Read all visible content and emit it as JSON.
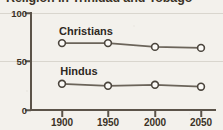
{
  "chart_data": {
    "type": "line",
    "title": "Religion in Trinidad and Tobago",
    "xlabel": "",
    "ylabel": "",
    "x": [
      1900,
      1950,
      2000,
      2050
    ],
    "xtick_labels": [
      "1900",
      "1950",
      "2000",
      "2050"
    ],
    "ytick_labels": [
      "0",
      "50",
      "100"
    ],
    "yticks": [
      0,
      50,
      100
    ],
    "ylim": [
      0,
      100
    ],
    "xlim": [
      1875,
      2075
    ],
    "grid": true,
    "legend": "inline-labels",
    "series": [
      {
        "name": "Christians",
        "values": [
          69,
          69,
          65,
          64
        ],
        "label_text": "Christians",
        "marker": "open-circle",
        "color": "#6b645a"
      },
      {
        "name": "Hindus",
        "values": [
          27,
          25,
          26,
          24
        ],
        "label_text": "Hindus",
        "marker": "open-circle",
        "color": "#6b645a"
      }
    ],
    "colors": {
      "background": "#f3f1ec",
      "axis": "#5b5349",
      "grid": "#d9d6ce",
      "line": "#6b645a",
      "marker_fill": "#fbfaf7",
      "text": "#3b3226"
    }
  }
}
